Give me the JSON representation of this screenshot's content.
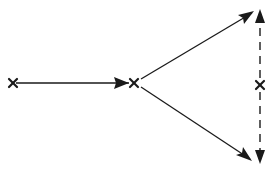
{
  "diagram": {
    "background": "#ffffff",
    "stroke_color": "#1a1a1a",
    "nodes": [
      {
        "id": "left",
        "x": 13,
        "y": 83,
        "marker": "x"
      },
      {
        "id": "middle",
        "x": 134,
        "y": 83,
        "marker": "x"
      },
      {
        "id": "right",
        "x": 260,
        "y": 85,
        "marker": "x"
      }
    ],
    "edges": [
      {
        "from": "left",
        "to": "middle",
        "style": "solid",
        "arrow": "end"
      },
      {
        "from": "middle",
        "to": "upper-right",
        "style": "solid",
        "arrow": "end"
      },
      {
        "from": "middle",
        "to": "lower-right",
        "style": "solid",
        "arrow": "end"
      },
      {
        "from": "right",
        "to": "top",
        "style": "dashed",
        "arrow": "end"
      },
      {
        "from": "right",
        "to": "bottom",
        "style": "dashed",
        "arrow": "end"
      }
    ]
  }
}
